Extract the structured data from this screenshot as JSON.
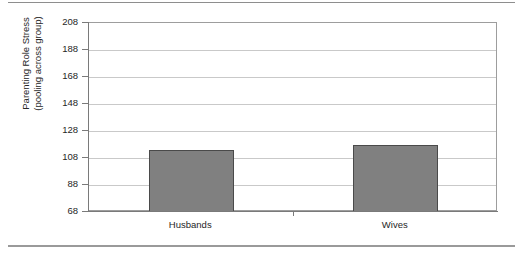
{
  "chart_data": {
    "type": "bar",
    "title": "",
    "xlabel": "",
    "ylabel": "Parenting Role Stress (pooling across group)",
    "ylabel_lines": [
      "Parenting Role Stress",
      "(pooling across group)"
    ],
    "categories": [
      "Husbands",
      "Wives"
    ],
    "values": [
      114,
      118
    ],
    "ylim": [
      68,
      208
    ],
    "yticks": [
      68,
      88,
      108,
      128,
      148,
      168,
      188,
      208
    ],
    "ytick_labels": [
      "68",
      "88",
      "108",
      "128",
      "148",
      "168",
      "188",
      "208"
    ],
    "grid": true,
    "legend": "none",
    "series": [
      {
        "name": "Parenting Role Stress",
        "values": [
          114,
          118
        ],
        "color": "#808080"
      }
    ]
  },
  "style": {
    "bar_fill": "#808080",
    "bar_border": "#4a4a4a",
    "gridline_color": "#c9c9c9",
    "axis_color": "#7a7a7a",
    "frame_color": "#9d9d9d",
    "text_color": "#262626",
    "background": "#ffffff"
  }
}
